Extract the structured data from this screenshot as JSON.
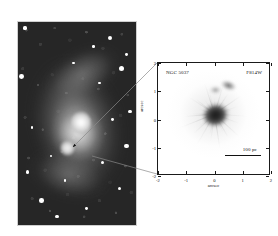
{
  "figure": {
    "caption_present": false,
    "panels": [
      "wide-field-galaxy-image",
      "hst-nuclear-inset"
    ]
  },
  "wide_field": {
    "name": "wide-field-optical-image",
    "description": "ground-based optical image of an interacting spiral galaxy with tidal arms and a bright nucleus",
    "background_color": "#262626",
    "stars": [
      {
        "x": 6,
        "y": 3,
        "r": 1.6
      },
      {
        "x": 78,
        "y": 8,
        "r": 2.1
      },
      {
        "x": 92,
        "y": 16,
        "r": 1.4
      },
      {
        "x": 3,
        "y": 27,
        "r": 2.4
      },
      {
        "x": 88,
        "y": 23,
        "r": 2.6
      },
      {
        "x": 69,
        "y": 30,
        "r": 1.3
      },
      {
        "x": 95,
        "y": 44,
        "r": 1.8
      },
      {
        "x": 80,
        "y": 48,
        "r": 1.4
      },
      {
        "x": 12,
        "y": 52,
        "r": 1.2
      },
      {
        "x": 92,
        "y": 61,
        "r": 2.2
      },
      {
        "x": 28,
        "y": 66,
        "r": 1.3
      },
      {
        "x": 72,
        "y": 69,
        "r": 1.5
      },
      {
        "x": 8,
        "y": 74,
        "r": 1.9
      },
      {
        "x": 40,
        "y": 78,
        "r": 1.2
      },
      {
        "x": 86,
        "y": 82,
        "r": 1.5
      },
      {
        "x": 20,
        "y": 88,
        "r": 2.3
      },
      {
        "x": 58,
        "y": 92,
        "r": 1.4
      },
      {
        "x": 33,
        "y": 96,
        "r": 1.6
      },
      {
        "x": 64,
        "y": 12,
        "r": 1.2
      },
      {
        "x": 47,
        "y": 20,
        "r": 1.1
      }
    ]
  },
  "callouts": {
    "name": "zoom-callout-lines",
    "color": "#8a8a8a",
    "upper_line": {
      "x1": 157,
      "y1": 63,
      "x2": 71,
      "y2": 148,
      "arrow": true
    },
    "lower_line": {
      "x1": 157,
      "y1": 174,
      "x2": 91,
      "y2": 155,
      "arrow": false
    }
  },
  "chart_data": {
    "type": "scatter",
    "title": "",
    "object_label": "NGC 5037",
    "filter_label": "F814W",
    "xlabel": "arcsec",
    "ylabel": "arcsec",
    "xlim": [
      -2,
      2
    ],
    "ylim": [
      -2,
      2
    ],
    "xticks": [
      -2,
      -1,
      0,
      1,
      2
    ],
    "xticklabels": [
      "-2",
      "-1",
      "0",
      "1",
      "2"
    ],
    "yticks": [
      -2,
      -1,
      0,
      1,
      2
    ],
    "yticklabels": [
      "-2",
      "-1",
      "0",
      "1",
      "2"
    ],
    "grid": false,
    "colormap": "greyscale-inverted",
    "annotations": [
      {
        "name": "scale-bar",
        "text": "100 pc",
        "x": 1.25,
        "y": -1.25,
        "length_arcsec": 1.3
      }
    ],
    "features": [
      {
        "name": "nuclear-core",
        "x": -0.05,
        "y": 0.15,
        "radius_arcsec": 0.45,
        "intensity": "dark"
      },
      {
        "name": "dust-clump-north",
        "x": 0.45,
        "y": 1.15,
        "radius_arcsec": 0.28,
        "intensity": "medium"
      },
      {
        "name": "dust-clump-north-inner",
        "x": 0.05,
        "y": 0.95,
        "radius_arcsec": 0.2,
        "intensity": "light"
      },
      {
        "name": "radial-filaments",
        "count": 28,
        "intensity": "light"
      }
    ]
  }
}
